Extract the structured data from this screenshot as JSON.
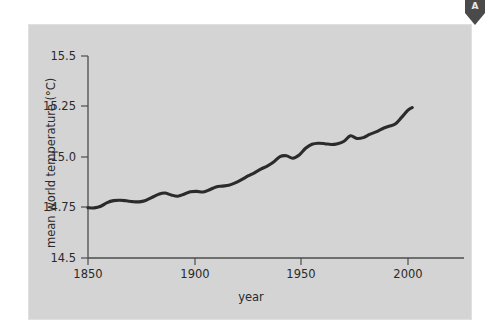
{
  "marker": {
    "name": "pennant-marker",
    "letter": "A",
    "color": "#4a4a4a"
  },
  "figure": {
    "panel_color": "#d4d4d4",
    "background_color": "#ffffff",
    "line_color": "#2b2b2b",
    "axis_color": "#4c4c4c"
  },
  "chart_data": {
    "type": "line",
    "title": "",
    "xlabel": "year",
    "ylabel": "mean world temperature (°C)",
    "xlim": [
      1850,
      2010
    ],
    "ylim": [
      14.5,
      15.5
    ],
    "xticks": [
      1850,
      1900,
      1950,
      2000
    ],
    "xticklabels": [
      "1850",
      "1900",
      "1950",
      "2000"
    ],
    "yticks": [
      14.5,
      14.75,
      15.0,
      15.25,
      15.5
    ],
    "yticklabels": [
      "14.5",
      "14.75",
      "15.0",
      "15.25",
      "15.5"
    ],
    "grid": false,
    "legend": null,
    "series": [
      {
        "name": "mean world temperature",
        "color": "#2b2b2b",
        "x": [
          1850,
          1853,
          1856,
          1859,
          1862,
          1865,
          1868,
          1871,
          1874,
          1877,
          1880,
          1883,
          1886,
          1889,
          1892,
          1895,
          1898,
          1901,
          1904,
          1907,
          1910,
          1913,
          1916,
          1919,
          1922,
          1925,
          1928,
          1931,
          1934,
          1937,
          1940,
          1943,
          1946,
          1949,
          1952,
          1955,
          1958,
          1961,
          1964,
          1967,
          1970,
          1973,
          1976,
          1979,
          1982,
          1985,
          1988,
          1991,
          1994,
          1997,
          2000,
          2002
        ],
        "y": [
          14.749,
          14.748,
          14.756,
          14.774,
          14.784,
          14.786,
          14.783,
          14.779,
          14.778,
          14.785,
          14.8,
          14.815,
          14.822,
          14.812,
          14.806,
          14.816,
          14.828,
          14.83,
          14.827,
          14.838,
          14.852,
          14.856,
          14.86,
          14.872,
          14.888,
          14.906,
          14.922,
          14.94,
          14.955,
          14.975,
          15.002,
          15.006,
          14.994,
          15.01,
          15.043,
          15.063,
          15.068,
          15.066,
          15.062,
          15.066,
          15.078,
          15.105,
          15.092,
          15.096,
          15.112,
          15.124,
          15.14,
          15.152,
          15.163,
          15.196,
          15.232,
          15.245
        ]
      }
    ]
  }
}
